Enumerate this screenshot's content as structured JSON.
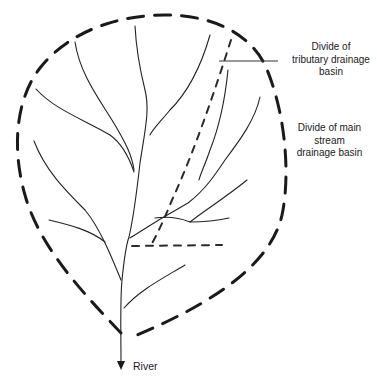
{
  "diagram": {
    "type": "drainage basin schematic",
    "labels": {
      "tributary_divide": [
        "Divide of",
        "tributary drainage",
        "basin"
      ],
      "main_divide": [
        "Divide of main",
        "stream",
        "drainage basin"
      ],
      "outlet": "River"
    },
    "elements": {
      "main_divide_style": "heavy dashed line (teardrop outline)",
      "tributary_divide_style": "light dashed line",
      "streams_style": "thin solid lines (branching network)",
      "outlet_marker": "downward arrow"
    },
    "colors": {
      "lines": "#1a1a1a",
      "background": "#ffffff"
    }
  }
}
